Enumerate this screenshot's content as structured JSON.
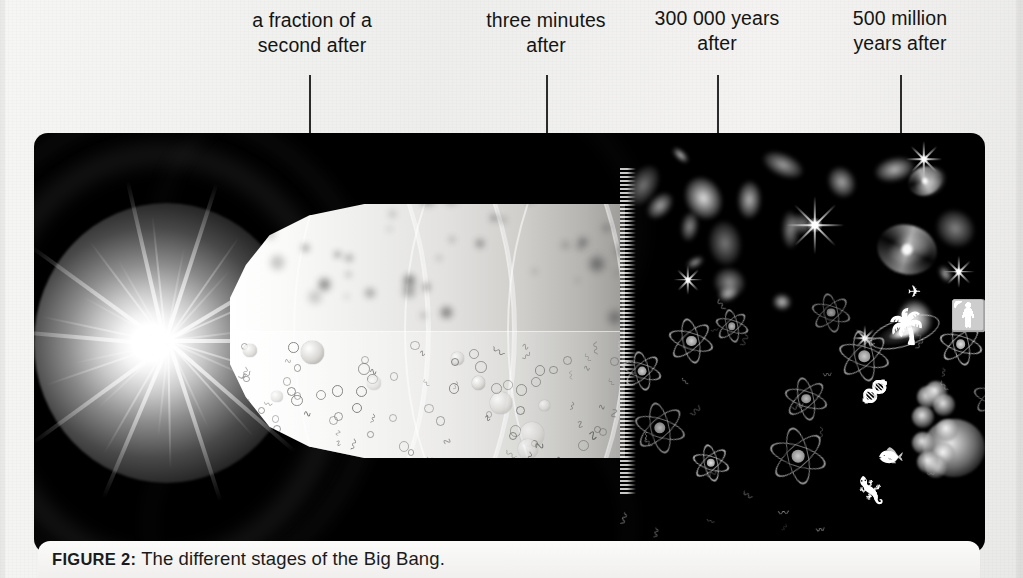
{
  "figure": {
    "caption_label": "FIGURE 2:",
    "caption_text": "The different stages of the Big Bang."
  },
  "timeline": {
    "stages": [
      {
        "id": "stage-fraction-of-second",
        "label": "a fraction of a\nsecond after",
        "label_x": 231,
        "label_y": 8,
        "label_w": 162,
        "leader_x": 309,
        "leader_y": 75,
        "leader_h": 58
      },
      {
        "id": "stage-three-minutes",
        "label": "three minutes\nafter",
        "label_x": 470,
        "label_y": 8,
        "label_w": 152,
        "leader_x": 546,
        "leader_y": 75,
        "leader_h": 58
      },
      {
        "id": "stage-300000-years",
        "label": "300 000 years\nafter",
        "label_x": 641,
        "label_y": 6,
        "label_w": 152,
        "leader_x": 717,
        "leader_y": 75,
        "leader_h": 58
      },
      {
        "id": "stage-500-million-years",
        "label": "500 million\nyears after",
        "label_x": 824,
        "label_y": 6,
        "label_w": 152,
        "leader_x": 900,
        "leader_y": 75,
        "leader_h": 58
      }
    ]
  },
  "scene": {
    "panel_background": "#000000",
    "burst_color": "#ffffff",
    "cone_color": "#eeeeec",
    "objects": [
      {
        "name": "big-bang-burst",
        "description": "radiant starburst of light at the origin"
      },
      {
        "name": "expanding-cone",
        "description": "widening funnel of hot plasma with concentric bands"
      },
      {
        "name": "particle-soup",
        "description": "quarks, electrons and energy squiggles"
      },
      {
        "name": "proton-formation",
        "description": "protons and neutrons coalescing"
      },
      {
        "name": "galaxy-field",
        "description": "fuzzy proto-galaxies and stars"
      },
      {
        "name": "spiral-galaxy",
        "description": "mature spiral galaxies and disks"
      },
      {
        "name": "atom-field",
        "description": "atoms with orbiting electrons"
      },
      {
        "name": "life-forms",
        "description": "dna, fish, dinosaur, palm tree, human figure"
      }
    ]
  },
  "colors": {
    "paper": "#f2f2f0",
    "ink": "#141414",
    "leader_line": "#2b2b2b"
  }
}
